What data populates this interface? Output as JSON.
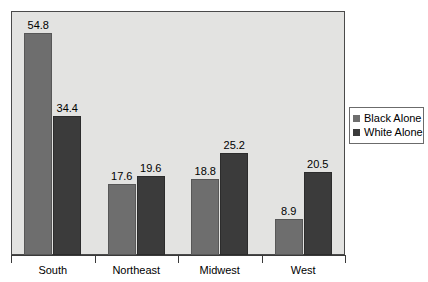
{
  "chart_data": {
    "type": "bar",
    "title": "",
    "subtitle": "",
    "xlabel": "",
    "ylabel": "",
    "categories": [
      "South",
      "Northeast",
      "Midwest",
      "West"
    ],
    "series": [
      {
        "name": "Black Alone",
        "color": "#6e6e6e",
        "values": [
          54.8,
          17.6,
          18.8,
          8.9
        ]
      },
      {
        "name": "White Alone",
        "color": "#3b3b3b",
        "values": [
          34.4,
          19.6,
          25.2,
          20.5
        ]
      }
    ],
    "value_labels": [
      [
        "54.8",
        "17.6",
        "18.8",
        "8.9"
      ],
      [
        "34.4",
        "19.6",
        "25.2",
        "20.5"
      ]
    ],
    "ylim": [
      0,
      60
    ],
    "grid": false,
    "y_axis_visible": false,
    "legend_position": "right",
    "plot_background": "#e3e3e1"
  },
  "legend": {
    "items": [
      {
        "label": "Black Alone",
        "color": "#6e6e6e"
      },
      {
        "label": "White Alone",
        "color": "#3b3b3b"
      }
    ]
  },
  "axis": {
    "categories": [
      {
        "label": "South"
      },
      {
        "label": "Northeast"
      },
      {
        "label": "Midwest"
      },
      {
        "label": "West"
      }
    ]
  }
}
